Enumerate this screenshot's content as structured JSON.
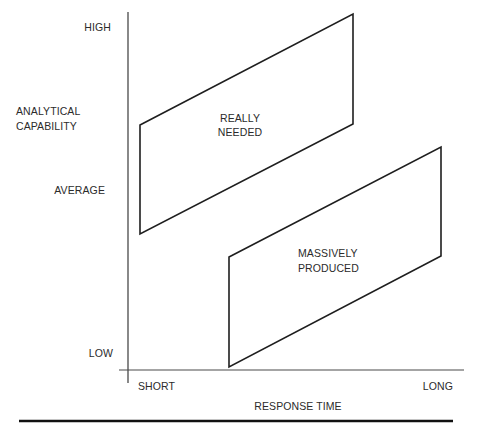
{
  "diagram": {
    "y_axis": {
      "title_line1": "ANALYTICAL",
      "title_line2": "CAPABILITY",
      "ticks": [
        "HIGH",
        "AVERAGE",
        "LOW"
      ]
    },
    "x_axis": {
      "title": "RESPONSE TIME",
      "ticks": [
        "SHORT",
        "LONG"
      ]
    },
    "regions": [
      {
        "id": "really-needed",
        "label_line1": "REALLY",
        "label_line2": "NEEDED",
        "polygon": [
          [
            140,
            125
          ],
          [
            353,
            14
          ],
          [
            353,
            124
          ],
          [
            140,
            234
          ]
        ]
      },
      {
        "id": "massively-produced",
        "label_line1": "MASSIVELY",
        "label_line2": "PRODUCED",
        "polygon": [
          [
            229,
            257
          ],
          [
            441,
            147
          ],
          [
            441,
            256
          ],
          [
            229,
            367
          ]
        ]
      }
    ],
    "colors": {
      "line": "#1e1e1e",
      "axis": "#3a3a3a",
      "text": "#2b2b2b",
      "background": "#ffffff"
    }
  }
}
